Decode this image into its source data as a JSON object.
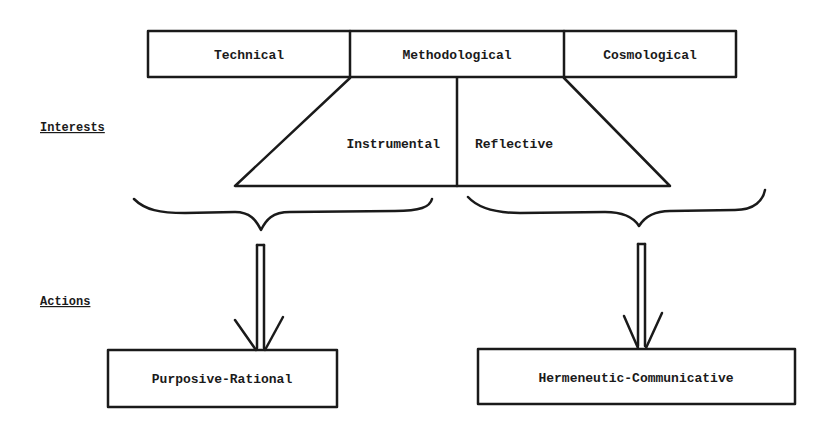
{
  "top_box": {
    "cells": [
      {
        "label": "Technical"
      },
      {
        "label": "Methodological"
      },
      {
        "label": "Cosmological"
      }
    ]
  },
  "side_labels": {
    "interests": "Interests",
    "actions": "Actions"
  },
  "trapezoid": {
    "left_label": "Instrumental",
    "right_label": "Reflective"
  },
  "bottom_boxes": [
    {
      "label": "Purposive-Rational"
    },
    {
      "label": "Hermeneutic-Communicative"
    }
  ],
  "colors": {
    "ink": "#1a1a1a",
    "background": "#ffffff"
  }
}
